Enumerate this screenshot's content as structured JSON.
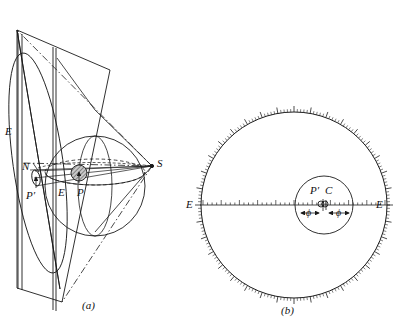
{
  "figure": {
    "caption_a": "(a)",
    "caption_b": "(b)",
    "line_color": "#1a1a1a",
    "fill_sphere": "#9a9a9a",
    "background": "#ffffff"
  },
  "panel_a": {
    "name": "sphere-and-projection-plane",
    "labels": {
      "plane_edge_left": "E",
      "north_pole": "N",
      "south_pole": "S",
      "projected_point": "P′",
      "equator_point": "E",
      "surface_point": "P"
    }
  },
  "panel_b": {
    "name": "graduated-circle-projection",
    "labels": {
      "axis_left": "E",
      "axis_right": "E",
      "inner_point_pprime": "P′",
      "inner_point_c": "C",
      "angle_left": "ϕ",
      "angle_right": "ϕ"
    }
  },
  "chart_data": {
    "type": "diagram",
    "panels": [
      {
        "id": "a",
        "caption": "(a)",
        "description": "Perspective view: a sphere with north pole N and south pole S, a projection plane (parallelogram) tangent at N, a shaded small sphere at interior point P, with projection rays from S through P to P' on the plane.",
        "elements": [
          {
            "name": "projection-plane",
            "type": "parallelogram"
          },
          {
            "name": "sphere-outline",
            "type": "circle"
          },
          {
            "name": "equator-ellipse",
            "type": "dashed-ellipse"
          },
          {
            "name": "meridian-ellipse",
            "type": "ellipse"
          },
          {
            "name": "projection-cone",
            "type": "dash-dot-lines",
            "apex": "S"
          },
          {
            "name": "shaded-inner-sphere",
            "type": "hatched-circle",
            "at": "P"
          }
        ],
        "points": [
          {
            "label": "E",
            "x": 10,
            "y": 132
          },
          {
            "label": "N",
            "x": 27,
            "y": 167
          },
          {
            "label": "P′",
            "x": 30,
            "y": 196
          },
          {
            "label": "E",
            "x": 62,
            "y": 192
          },
          {
            "label": "P",
            "x": 80,
            "y": 192
          },
          {
            "label": "S",
            "x": 156,
            "y": 163
          }
        ]
      },
      {
        "id": "b",
        "caption": "(b)",
        "description": "Plan view: large graduated circle with fine tick marks around its circumference, a horizontal diameter axis labelled E at both ends carrying a linear scale, and an inner circle containing points P' and C with two angular offsets phi measured either side of centre.",
        "elements": [
          {
            "name": "outer-graduated-circle",
            "type": "circle",
            "cx": 294,
            "cy": 205,
            "r": 93
          },
          {
            "name": "inner-circle",
            "type": "circle",
            "cx": 324,
            "cy": 205,
            "r": 29
          },
          {
            "name": "horizontal-axis",
            "type": "scaled-line"
          },
          {
            "name": "phi-arrow-left",
            "type": "double-arrow"
          },
          {
            "name": "phi-arrow-right",
            "type": "double-arrow"
          }
        ],
        "points": [
          {
            "label": "E",
            "x": 190,
            "y": 205
          },
          {
            "label": "E",
            "x": 379,
            "y": 205
          },
          {
            "label": "P′",
            "x": 315,
            "y": 192
          },
          {
            "label": "C",
            "x": 330,
            "y": 191
          },
          {
            "label": "ϕ",
            "x": 313,
            "y": 215
          },
          {
            "label": "ϕ",
            "x": 340,
            "y": 215
          }
        ],
        "tick_counts": {
          "outer_circle_minor": 180,
          "outer_circle_major": 36,
          "axis_scale": 40
        }
      }
    ]
  }
}
